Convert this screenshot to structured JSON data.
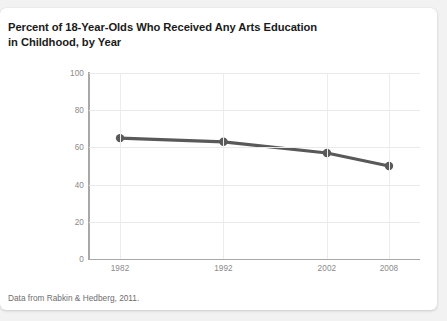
{
  "chart_data": {
    "type": "line",
    "title": "Percent of 18-Year-Olds Who Received Any Arts Education in Childhood, by Year",
    "title_lines": [
      "Percent of 18-Year-Olds Who Received Any Arts Education",
      "in Childhood, by Year"
    ],
    "footnote": "Data from Rabkin & Hedberg, 2011.",
    "x": [
      1982,
      1992,
      2002,
      2008
    ],
    "x_tick_labels": [
      "1982",
      "1992",
      "2002",
      "2008"
    ],
    "values": [
      65,
      63,
      57,
      50
    ],
    "series": [
      {
        "name": "Percent receiving any arts education",
        "values": [
          65,
          63,
          57,
          50
        ]
      }
    ],
    "xlabel": "",
    "ylabel": "",
    "ylim": [
      0,
      100
    ],
    "xlim": [
      1979,
      2011
    ],
    "y_ticks": [
      0,
      20,
      40,
      60,
      80,
      100
    ],
    "y_tick_labels": [
      "0",
      "20",
      "40",
      "60",
      "80",
      "100"
    ],
    "grid": "horizontal-and-vertical",
    "legend": "none",
    "line_color": "#595959",
    "marker_color": "#595959",
    "grid_color": "#e9e9e9",
    "axis_color": "#a8a8a8",
    "tick_label_color": "#8a8a8a",
    "title_color": "#1a1a1a",
    "background_color": "#ffffff",
    "page_background_color": "#f2f2f2"
  }
}
